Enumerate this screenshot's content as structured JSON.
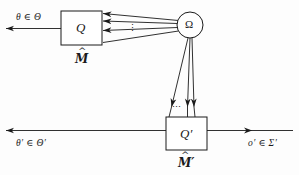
{
  "figure": {
    "type": "diagram",
    "background_color": "#fdfdfd",
    "line_color": "#1a1a1a",
    "text_color": "#1a1a1a"
  },
  "nodes": {
    "q_box": {
      "label": "Q",
      "machine_label": "M",
      "machine_hat": "^",
      "x": 61,
      "y": 11,
      "w": 41,
      "h": 34
    },
    "q_prime_box": {
      "label": "Q′",
      "machine_label": "M′",
      "machine_hat": "^",
      "x": 166,
      "y": 117,
      "w": 41,
      "h": 33
    },
    "omega": {
      "label": "Ω",
      "cx": 190,
      "cy": 25,
      "r": 13
    }
  },
  "edge_labels": {
    "top_left_input": "θ ∈ Θ",
    "bottom_left_input": "θ′ ∈ Θ′",
    "bottom_right_output": "o′ ∈ Σ′"
  },
  "ellipses": {
    "upper_bundle_dots": "⋮",
    "lower_bundle_dots": "⋯"
  },
  "bundles": {
    "q_to_omega": {
      "count": 4,
      "direction": "omega-to-q",
      "note": "four converging lines from Omega fanning out to the right edge of Q, arrowheads pointing left into Q, vertical ellipsis between middle lines"
    },
    "q_prime_to_omega": {
      "count": 3,
      "direction": "omega-to-q-prime",
      "note": "three converging lines from Omega fanning down to the top edge of Q-prime, arrowheads pointing down into Q-prime, horizontal ellipsis between lines"
    }
  }
}
